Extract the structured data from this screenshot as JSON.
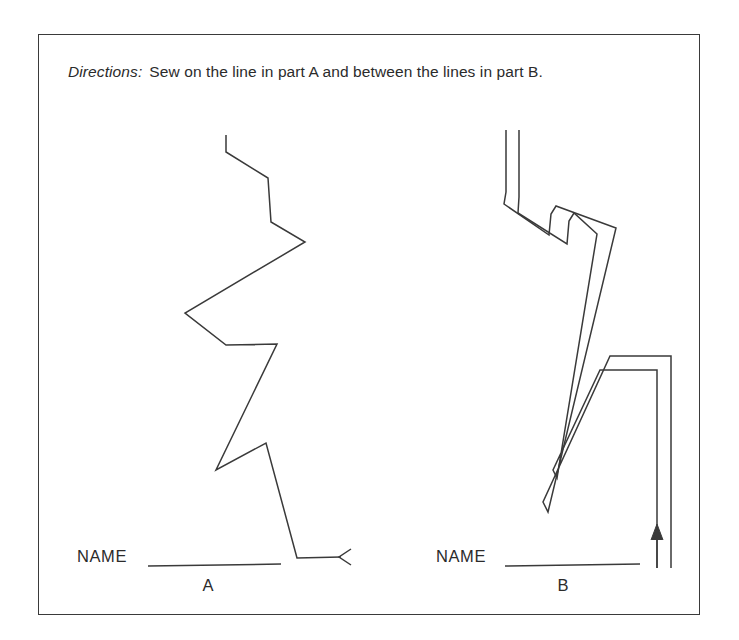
{
  "worksheet": {
    "directions": {
      "label": "Directions:",
      "text": "Sew on the line in part A and between the lines in part B."
    },
    "parts": [
      {
        "id": "A",
        "letter": "A",
        "name_label": "NAME",
        "type": "single-line-zigzag",
        "arrow_direction": "left",
        "arrow_style": "open-chevron"
      },
      {
        "id": "B",
        "letter": "B",
        "name_label": "NAME",
        "type": "double-line-channel",
        "arrow_direction": "up",
        "arrow_style": "filled-head"
      }
    ],
    "colors": {
      "ink": "#3a3a3a",
      "text": "#2b2b2b",
      "paper": "#ffffff",
      "border": "#3a3a3a"
    }
  },
  "geometry": {
    "border": {
      "x": 38,
      "y": 34,
      "width": 662,
      "height": 581
    },
    "part_a_path": "M 226,135 L 226,152 L 268,178 L 271,222 L 305,242 L 185,313 L 226,345 L 277,344 L 216,470 L 266,443 L 297,558 L 341,557",
    "part_a_arrow": "M 351,549 L 339,557 L 351,565",
    "part_a_name_line": "M 148,566 L 281,564",
    "part_b_outer_path": "M 506,130 L 506,192 L 504,204 L 549,235 L 551,214 L 556,206 L 616,228 L 548,512 L 543,502 L 610,356 L 671,356 L 671,568",
    "part_b_inner_path": "M 519,130 L 519,197 L 518,213 L 567,244 L 569,221 L 574,213 L 597,234 L 557,478 L 553,470 L 600,370 L 657,370 L 657,568",
    "part_b_name_line": "M 505,566 L 640,564",
    "part_b_arrow_shaft": "M 657,568 L 657,528",
    "part_b_arrow_head": "M 651,540 L 657,524 L 663,540"
  }
}
